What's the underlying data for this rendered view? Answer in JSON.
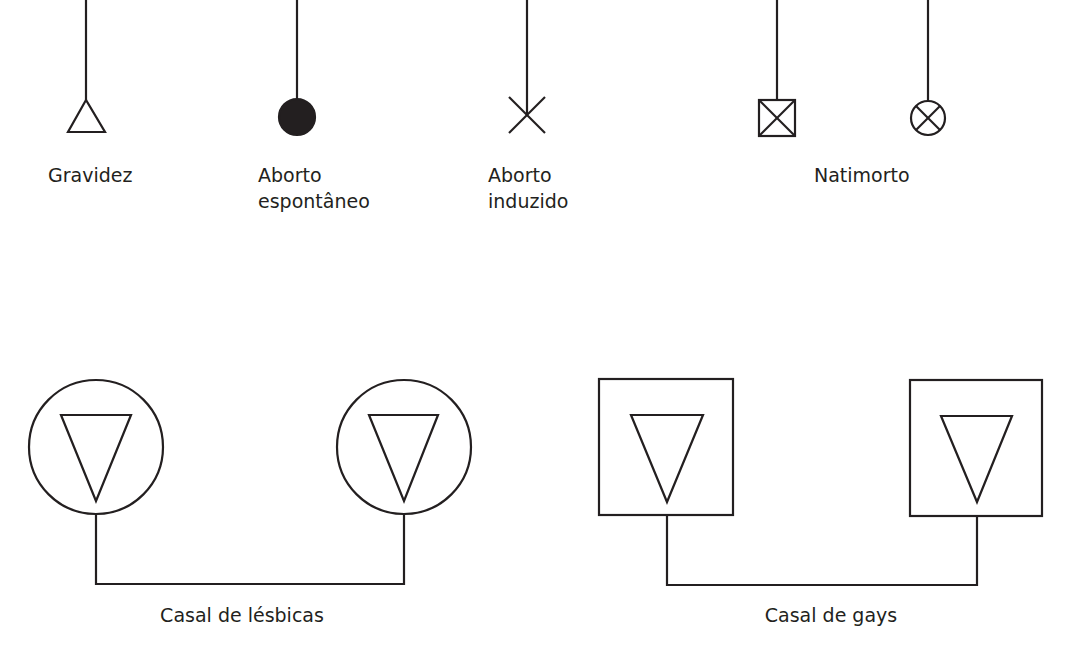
{
  "diagram": {
    "type": "pedigree-symbols",
    "stroke_color": "#231f20",
    "background": "#ffffff",
    "symbols": [
      {
        "id": "gravidez",
        "shape": "triangle-up",
        "lines": [
          "Gravidez"
        ]
      },
      {
        "id": "aborto-espontaneo",
        "shape": "filled-circle",
        "lines": [
          "Aborto",
          "espontâneo"
        ]
      },
      {
        "id": "aborto-induzido",
        "shape": "x-cross",
        "lines": [
          "Aborto",
          "induzido"
        ]
      },
      {
        "id": "natimorto",
        "shape": [
          "crossed-square",
          "crossed-circle"
        ],
        "lines": [
          "Natimorto"
        ]
      }
    ],
    "couples": [
      {
        "id": "casal-lesbicas",
        "shape": "circle-with-inverted-triangle",
        "label": "Casal de lésbicas"
      },
      {
        "id": "casal-gays",
        "shape": "square-with-inverted-triangle",
        "label": "Casal de gays"
      }
    ]
  }
}
